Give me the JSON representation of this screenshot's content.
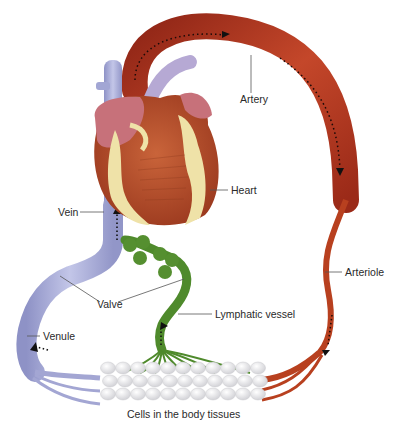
{
  "labels": {
    "artery": "Artery",
    "heart": "Heart",
    "vein": "Vein",
    "valve": "Valve",
    "venule": "Venule",
    "arteriole": "Arteriole",
    "lymphatic_vessel": "Lymphatic vessel",
    "cells": "Cells in the body tissues"
  },
  "colors": {
    "artery": "#b83a22",
    "vein": "#a9acd6",
    "lymph": "#4f8a2c",
    "heart_muscle": "#c0552f",
    "heart_fat": "#efe2a8",
    "atrium": "#c7717a",
    "cells": "#eeeeee"
  }
}
